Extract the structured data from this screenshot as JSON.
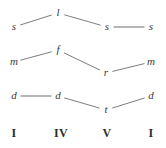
{
  "figure": {
    "background_color": "#ffffff",
    "line_color": "#6e6e6e",
    "note_color": "#3a3a3a",
    "numeral_color": "#2d2d2d",
    "width": 166,
    "height": 148
  },
  "columns": [
    {
      "label": "I",
      "x": 14
    },
    {
      "label": "IV",
      "x": 61
    },
    {
      "label": "V",
      "x": 107
    },
    {
      "label": "I",
      "x": 151
    }
  ],
  "numerals_y": 133,
  "voices": [
    {
      "name": "upper-voice",
      "notes": [
        {
          "label": "s",
          "x": 14,
          "y": 27
        },
        {
          "label": "l",
          "x": 58,
          "y": 13
        },
        {
          "label": "s",
          "x": 107,
          "y": 27
        },
        {
          "label": "s",
          "x": 151,
          "y": 27
        }
      ]
    },
    {
      "name": "middle-voice",
      "notes": [
        {
          "label": "m",
          "x": 14,
          "y": 62
        },
        {
          "label": "f",
          "x": 58,
          "y": 50
        },
        {
          "label": "r",
          "x": 106,
          "y": 73
        },
        {
          "label": "m",
          "x": 151,
          "y": 62
        }
      ]
    },
    {
      "name": "lower-voice",
      "notes": [
        {
          "label": "d",
          "x": 14,
          "y": 96
        },
        {
          "label": "d",
          "x": 58,
          "y": 96
        },
        {
          "label": "t",
          "x": 106,
          "y": 110
        },
        {
          "label": "d",
          "x": 151,
          "y": 96
        }
      ]
    }
  ],
  "chart_data": {
    "type": "line",
    "xlabel": "",
    "ylabel": "",
    "categories": [
      "I",
      "IV",
      "V",
      "I"
    ],
    "grid": false,
    "legend": "none",
    "axis_ranges": {
      "x": [
        0,
        3
      ],
      "y_pixels_top_to_bottom": [
        13,
        110
      ]
    },
    "series": [
      {
        "name": "upper-voice",
        "labels": [
          "s",
          "l",
          "s",
          "s"
        ],
        "x": [
          14,
          58,
          107,
          151
        ],
        "y": [
          27,
          13,
          27,
          27
        ]
      },
      {
        "name": "middle-voice",
        "labels": [
          "m",
          "f",
          "r",
          "m"
        ],
        "x": [
          14,
          58,
          106,
          151
        ],
        "y": [
          62,
          50,
          73,
          62
        ]
      },
      {
        "name": "lower-voice",
        "labels": [
          "d",
          "d",
          "t",
          "d"
        ],
        "x": [
          14,
          58,
          106,
          151
        ],
        "y": [
          96,
          96,
          110,
          96
        ]
      }
    ],
    "annotations": [
      "I",
      "IV",
      "V",
      "I"
    ]
  }
}
